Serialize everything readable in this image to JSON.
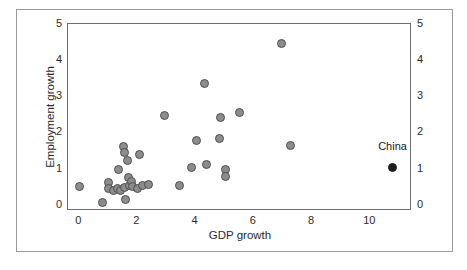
{
  "chart_data": {
    "type": "scatter",
    "title": "",
    "xlabel": "GDP growth",
    "ylabel": "Employment growth",
    "xlim": [
      -0.35,
      11.4
    ],
    "ylim": [
      -0.12,
      5.0
    ],
    "xticks": [
      0,
      2,
      4,
      6,
      8,
      10
    ],
    "xticklabels": [
      "0",
      "2",
      "4",
      "6",
      "8",
      "10"
    ],
    "yticks": [
      0,
      1,
      2,
      3,
      4,
      5
    ],
    "yticklabels": [
      "0",
      "1",
      "2",
      "3",
      "4",
      "5"
    ],
    "y2ticks": [
      0,
      1,
      2,
      3,
      4,
      5
    ],
    "y2ticklabels": [
      "0",
      "1",
      "2",
      "3",
      "4",
      "5"
    ],
    "grid": false,
    "legend": false,
    "marker_color": "#8c8c8c",
    "marker_edge_color": "#4f4f4f",
    "highlight_color": "#1e1e1e",
    "frame_color": "#6f6f6f",
    "series": [
      {
        "name": "countries",
        "marker": "circle-gray",
        "points": [
          {
            "x": 0.05,
            "y": 0.5
          },
          {
            "x": 0.85,
            "y": 0.05
          },
          {
            "x": 1.05,
            "y": 0.62
          },
          {
            "x": 1.05,
            "y": 0.44
          },
          {
            "x": 1.2,
            "y": 0.4
          },
          {
            "x": 1.35,
            "y": 0.46
          },
          {
            "x": 1.4,
            "y": 0.98
          },
          {
            "x": 1.45,
            "y": 0.4
          },
          {
            "x": 1.55,
            "y": 1.6
          },
          {
            "x": 1.58,
            "y": 1.44
          },
          {
            "x": 1.6,
            "y": 0.47
          },
          {
            "x": 1.62,
            "y": 0.13
          },
          {
            "x": 1.7,
            "y": 1.22
          },
          {
            "x": 1.72,
            "y": 0.74
          },
          {
            "x": 1.75,
            "y": 0.52
          },
          {
            "x": 1.82,
            "y": 0.64
          },
          {
            "x": 1.88,
            "y": 0.5
          },
          {
            "x": 2.05,
            "y": 0.44
          },
          {
            "x": 2.1,
            "y": 1.38
          },
          {
            "x": 2.22,
            "y": 0.52
          },
          {
            "x": 2.42,
            "y": 0.57
          },
          {
            "x": 2.98,
            "y": 2.46
          },
          {
            "x": 3.48,
            "y": 0.52
          },
          {
            "x": 3.88,
            "y": 1.04
          },
          {
            "x": 4.05,
            "y": 1.78
          },
          {
            "x": 4.35,
            "y": 3.36
          },
          {
            "x": 4.42,
            "y": 1.1
          },
          {
            "x": 4.85,
            "y": 1.82
          },
          {
            "x": 4.9,
            "y": 2.42
          },
          {
            "x": 5.05,
            "y": 0.98
          },
          {
            "x": 5.05,
            "y": 0.79
          },
          {
            "x": 5.55,
            "y": 2.56
          },
          {
            "x": 6.98,
            "y": 4.47
          },
          {
            "x": 7.28,
            "y": 1.64
          }
        ]
      },
      {
        "name": "China",
        "marker": "circle-black",
        "points": [
          {
            "x": 10.8,
            "y": 1.02
          }
        ]
      }
    ],
    "annotations": [
      {
        "text": "China",
        "x": 10.8,
        "y": 1.62
      }
    ]
  }
}
